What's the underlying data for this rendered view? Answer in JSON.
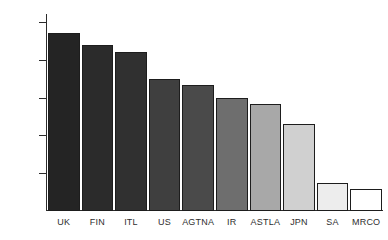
{
  "chart_data": {
    "type": "bar",
    "title": "",
    "subtitle": "",
    "xlabel": "",
    "ylabel": "",
    "categories": [
      "UK",
      "FIN",
      "ITL",
      "US",
      "AGTNA",
      "IR",
      "ASTLA",
      "JPN",
      "SA",
      "MRCO"
    ],
    "values": [
      470,
      440,
      420,
      350,
      333,
      300,
      283,
      230,
      75,
      57
    ],
    "bar_colors": [
      "#242424",
      "#2b2b2b",
      "#303030",
      "#3f3f3f",
      "#4a4a4a",
      "#6e6e6e",
      "#a8a8a8",
      "#d0d0d0",
      "#ededed",
      "#ffffff"
    ],
    "bar_border_color": "#1d1d1d",
    "ylim": [
      0,
      520
    ],
    "yticks": [
      100,
      200,
      300,
      400,
      500
    ],
    "ytick_labels": [
      "100",
      "200",
      "300",
      "400",
      "500"
    ],
    "grid": false,
    "legend": null,
    "axis_color": "#2b2b2b",
    "background": "#ffffff"
  },
  "axis": {
    "y_ticks": [
      {
        "label": "500",
        "value": 500
      },
      {
        "label": "400",
        "value": 400
      },
      {
        "label": "300",
        "value": 300
      },
      {
        "label": "200",
        "value": 200
      },
      {
        "label": "100",
        "value": 100
      }
    ]
  }
}
